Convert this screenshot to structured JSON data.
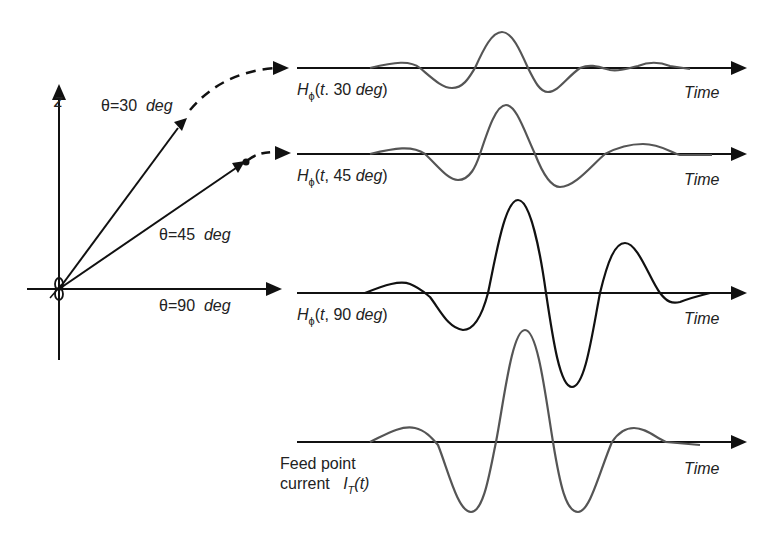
{
  "axes": {
    "z_label": "z",
    "angles": [
      {
        "theta": "θ=30",
        "unit": "deg"
      },
      {
        "theta": "θ=45",
        "unit": "deg"
      },
      {
        "theta": "θ=90",
        "unit": "deg"
      }
    ]
  },
  "waveforms": [
    {
      "name": "H",
      "sub": "ϕ",
      "args_pre": "(",
      "t": "t",
      "sep": ". 30 ",
      "unit": "deg",
      "close": ")",
      "time_label": "Time",
      "color": "#555555"
    },
    {
      "name": "H",
      "sub": "ϕ",
      "args_pre": "(",
      "t": "t",
      "sep": ", 45 ",
      "unit": "deg",
      "close": ")",
      "time_label": "Time",
      "color": "#555555"
    },
    {
      "name": "H",
      "sub": "ϕ",
      "args_pre": "(",
      "t": "t",
      "sep": ", 90 ",
      "unit": "deg",
      "close": ")",
      "time_label": "Time",
      "color": "#111111"
    },
    {
      "line1": "Feed point",
      "line2": "current",
      "name": "I",
      "sub": "T",
      "arg": "(t)",
      "time_label": "Time",
      "color": "#555555"
    }
  ]
}
